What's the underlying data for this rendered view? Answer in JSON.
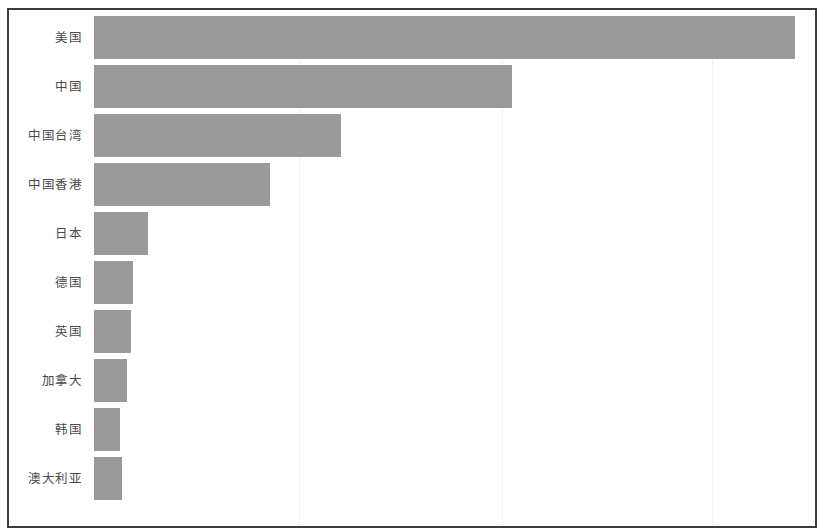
{
  "chart_data": {
    "type": "bar",
    "orientation": "horizontal",
    "title": "",
    "subtitle": "",
    "xlabel": "",
    "ylabel": "",
    "categories": [
      "美国",
      "中国",
      "中国台湾",
      "中国香港",
      "日本",
      "德国",
      "英国",
      "加拿大",
      "韩国",
      "澳大利亚"
    ],
    "values": [
      100.0,
      59.7,
      35.2,
      25.1,
      7.7,
      5.6,
      5.3,
      4.7,
      3.7,
      4.0
    ],
    "xlim": [
      0,
      100
    ],
    "grid": true,
    "grid_axis": "x",
    "legend": null,
    "tick_labels_x": [],
    "annotations": [],
    "series": [
      {
        "name": "数量",
        "values": [
          100.0,
          59.7,
          35.2,
          25.1,
          7.7,
          5.6,
          5.3,
          4.7,
          3.7,
          4.0
        ]
      }
    ]
  },
  "style": {
    "bar_color": "#9a9a9a",
    "frame_color": "#3c3c3c",
    "gridline_color": "#f2f2f2",
    "label_color": "#4a4a4a",
    "background": "#ffffff"
  },
  "gridlines_x": [
    297,
    500,
    710
  ]
}
